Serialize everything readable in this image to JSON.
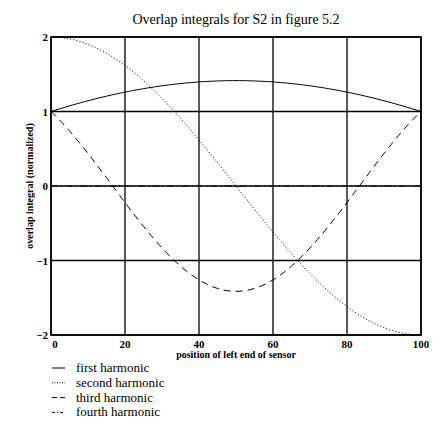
{
  "chart_data": {
    "type": "line",
    "title": "Overlap integrals for S2 in figure 5.2",
    "xlabel": "position of left end of sensor",
    "ylabel": "overlap integral (normalized)",
    "xlim": [
      0,
      100
    ],
    "ylim": [
      -2,
      2
    ],
    "xticks": [
      0,
      20,
      40,
      60,
      80,
      100
    ],
    "xtick_labels": [
      "0",
      "20",
      "40",
      "60",
      "80",
      "100"
    ],
    "yticks": [
      2,
      1,
      0,
      -1,
      -2
    ],
    "ytick_labels": [
      "2",
      "1",
      "0",
      "−1",
      "−2"
    ],
    "grid": true,
    "legend_position": "below-left",
    "x": [
      0,
      10,
      20,
      30,
      40,
      50,
      60,
      70,
      80,
      90,
      100
    ],
    "series": [
      {
        "name": "first harmonic",
        "style": "solid",
        "values": [
          1.0,
          1.111,
          1.206,
          1.283,
          1.338,
          1.414,
          1.338,
          1.283,
          1.206,
          1.111,
          1.0
        ]
      },
      {
        "name": "second harmonic",
        "style": "dotted",
        "values": [
          2.0,
          1.902,
          1.618,
          1.176,
          0.618,
          0.0,
          -0.618,
          -1.176,
          -1.618,
          -1.902,
          -2.0
        ]
      },
      {
        "name": "third harmonic",
        "style": "dashed",
        "values": [
          1.0,
          0.642,
          0.221,
          -0.221,
          -0.642,
          -1.414,
          -0.642,
          -0.221,
          0.221,
          0.642,
          1.0
        ]
      },
      {
        "name": "fourth harmonic",
        "style": "dashdot",
        "values": [
          0,
          0,
          0,
          0,
          0,
          0,
          0,
          0,
          0,
          0,
          0
        ]
      }
    ]
  },
  "legend": [
    {
      "label": "first harmonic",
      "style": "solid"
    },
    {
      "label": "second harmonic",
      "style": "dotted"
    },
    {
      "label": "third harmonic",
      "style": "dashed"
    },
    {
      "label": "fourth harmonic",
      "style": "dashdot"
    }
  ]
}
